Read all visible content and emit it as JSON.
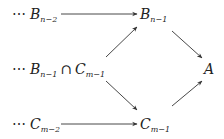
{
  "diagram": {
    "nodes": {
      "b_n2": {
        "prefix": "⋯",
        "symbol": "B",
        "subscript": "n−2"
      },
      "b_n1": {
        "symbol": "B",
        "subscript": "n−1"
      },
      "intersection": {
        "prefix": "⋯",
        "left_symbol": "B",
        "left_subscript": "n−1",
        "operator": "∩",
        "right_symbol": "C",
        "right_subscript": "m−1"
      },
      "a": {
        "symbol": "A"
      },
      "c_m2": {
        "prefix": "⋯",
        "symbol": "C",
        "subscript": "m−2"
      },
      "c_m1": {
        "symbol": "C",
        "subscript": "m−1"
      }
    },
    "edges": [
      {
        "from": "B_{n-2}",
        "to": "B_{n-1}"
      },
      {
        "from": "B_{n-1} ∩ C_{m-1}",
        "to": "B_{n-1}"
      },
      {
        "from": "B_{n-1} ∩ C_{m-1}",
        "to": "C_{m-1}"
      },
      {
        "from": "B_{n-1}",
        "to": "A"
      },
      {
        "from": "C_{m-1}",
        "to": "A"
      },
      {
        "from": "C_{m-2}",
        "to": "C_{m-1}"
      }
    ],
    "colors": {
      "stroke": "#333333",
      "text": "#222222"
    }
  }
}
